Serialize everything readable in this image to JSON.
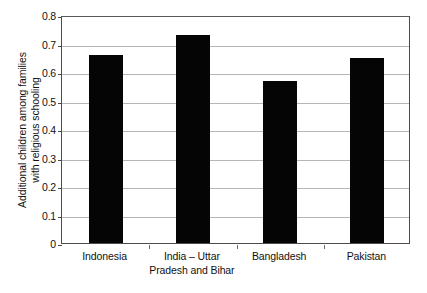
{
  "chart_data": {
    "type": "bar",
    "title": "",
    "subtitle": "",
    "xlabel": "",
    "ylabel": "Additional children among families with religious schooling",
    "ylabel_lines": [
      "Additional children among families",
      "with religious schooling"
    ],
    "categories": [
      "Indonesia",
      "India – Uttar Pradesh and Bihar",
      "Bangladesh",
      "Pakistan"
    ],
    "category_lines": [
      [
        "Indonesia"
      ],
      [
        "India – Uttar",
        "Pradesh and Bihar"
      ],
      [
        "Bangladesh"
      ],
      [
        "Pakistan"
      ]
    ],
    "values": [
      0.66,
      0.73,
      0.57,
      0.65
    ],
    "ylim": [
      0,
      0.8
    ],
    "ytick_values": [
      0,
      0.1,
      0.2,
      0.3,
      0.4,
      0.5,
      0.6,
      0.7,
      0.8
    ],
    "ytick_labels": [
      "0",
      "0.1",
      "0.2",
      "0.3",
      "0.4",
      "0.5",
      "0.6",
      "0.7",
      "0.8"
    ],
    "grid": true,
    "grid_axis": "y",
    "legend": null,
    "legend_position": "none",
    "bar_color": "#050505",
    "grid_color": "#b5b5b5",
    "axis_color": "#4c4c4c",
    "background_color": "#ffffff",
    "annotations": []
  }
}
